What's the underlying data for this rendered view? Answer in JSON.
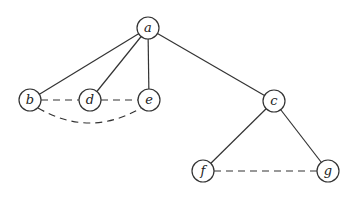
{
  "diagram": {
    "type": "graph",
    "nodes": [
      {
        "id": "a",
        "label": "a",
        "x": 148,
        "y": 28
      },
      {
        "id": "b",
        "label": "b",
        "x": 30,
        "y": 100
      },
      {
        "id": "d",
        "label": "d",
        "x": 90,
        "y": 100
      },
      {
        "id": "e",
        "label": "e",
        "x": 149,
        "y": 100
      },
      {
        "id": "c",
        "label": "c",
        "x": 274,
        "y": 101
      },
      {
        "id": "f",
        "label": "f",
        "x": 203,
        "y": 171
      },
      {
        "id": "g",
        "label": "g",
        "x": 328,
        "y": 171
      }
    ],
    "edges": [
      {
        "from": "a",
        "to": "b",
        "style": "solid"
      },
      {
        "from": "a",
        "to": "d",
        "style": "solid"
      },
      {
        "from": "a",
        "to": "e",
        "style": "solid"
      },
      {
        "from": "a",
        "to": "c",
        "style": "solid"
      },
      {
        "from": "c",
        "to": "f",
        "style": "solid"
      },
      {
        "from": "c",
        "to": "g",
        "style": "solid"
      },
      {
        "from": "b",
        "to": "d",
        "style": "dashed"
      },
      {
        "from": "d",
        "to": "e",
        "style": "dashed"
      },
      {
        "from": "b",
        "to": "e",
        "style": "dashed-curved"
      },
      {
        "from": "f",
        "to": "g",
        "style": "dashed"
      }
    ]
  }
}
